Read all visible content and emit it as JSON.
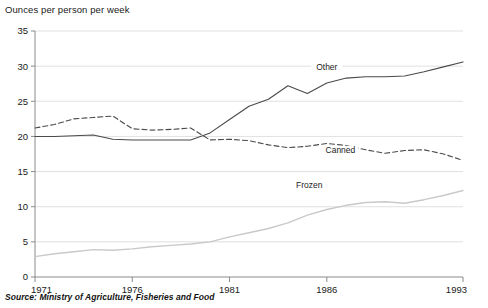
{
  "chart_data": {
    "type": "line",
    "title": "Ounces per person per week",
    "subtitle": "",
    "xlabel": "",
    "ylabel": "Ounces per person per week",
    "ylim": [
      0,
      35
    ],
    "xlim": [
      1971,
      1993
    ],
    "ytick_labels": [
      "0",
      "5",
      "10",
      "15",
      "20",
      "25",
      "30",
      "35"
    ],
    "ytick_values": [
      0,
      5,
      10,
      15,
      20,
      25,
      30,
      35
    ],
    "xtick_labels": [
      "1971",
      "1976",
      "1981",
      "1986",
      "1993"
    ],
    "xtick_values": [
      1971,
      1976,
      1981,
      1986,
      1993
    ],
    "grid": true,
    "legend_position": "inline-labels",
    "x": [
      1971,
      1972,
      1973,
      1974,
      1975,
      1976,
      1977,
      1978,
      1979,
      1980,
      1981,
      1982,
      1983,
      1984,
      1985,
      1986,
      1987,
      1988,
      1989,
      1990,
      1991,
      1992,
      1993
    ],
    "series": [
      {
        "name": "Other",
        "style": "solid",
        "color": "#4a4a4a",
        "label_x": 1986.0,
        "label_y": 29.4,
        "values": [
          20.0,
          20.0,
          20.1,
          20.2,
          19.6,
          19.5,
          19.5,
          19.5,
          19.5,
          20.5,
          22.4,
          24.3,
          25.3,
          27.2,
          26.1,
          27.6,
          28.3,
          28.5,
          28.5,
          28.6,
          29.2,
          29.9,
          30.6
        ]
      },
      {
        "name": "Canned",
        "style": "dashed",
        "color": "#4a4a4a",
        "label_x": 1986.7,
        "label_y": 17.6,
        "values": [
          21.2,
          21.7,
          22.5,
          22.7,
          22.9,
          21.1,
          20.9,
          21.0,
          21.2,
          19.5,
          19.6,
          19.4,
          18.8,
          18.4,
          18.6,
          19.0,
          18.7,
          18.1,
          17.6,
          18.0,
          18.1,
          17.5,
          16.6
        ]
      },
      {
        "name": "Frozen",
        "style": "solid",
        "color": "#c9c9c9",
        "label_x": 1985.1,
        "label_y": 12.6,
        "values": [
          2.9,
          3.3,
          3.6,
          3.9,
          3.8,
          4.0,
          4.3,
          4.5,
          4.7,
          5.0,
          5.7,
          6.3,
          6.9,
          7.7,
          8.8,
          9.6,
          10.2,
          10.6,
          10.7,
          10.5,
          11.0,
          11.6,
          12.3
        ]
      }
    ],
    "source": "Source: Ministry of Agriculture, Fisheries and Food"
  }
}
